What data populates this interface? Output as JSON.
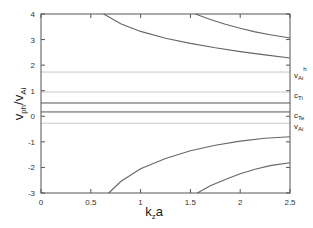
{
  "chart_data": {
    "type": "line",
    "title": "",
    "xlabel": "k_z a",
    "ylabel": "v_ph / v_Ai",
    "xlim": [
      0,
      2.5
    ],
    "ylim": [
      -3,
      4
    ],
    "grid": false,
    "legend": null,
    "x_ticks": [
      0,
      0.5,
      1,
      1.5,
      2,
      2.5
    ],
    "x_tick_labels": [
      "0",
      "0.5",
      "1",
      "1.5",
      "2",
      "2.5"
    ],
    "y_ticks": [
      -3,
      -2,
      -1,
      0,
      1,
      2,
      3,
      4
    ],
    "y_tick_labels": [
      "-3",
      "-2",
      "-1",
      "0",
      "1",
      "2",
      "3",
      "4"
    ],
    "horizontal_lines": [
      {
        "name": "v_Ai^h",
        "y": 1.73,
        "color": "#c8c8c8",
        "label": "v",
        "sub": "Ai",
        "sup": "h"
      },
      {
        "name": "c_Ti",
        "y": 0.95,
        "color": "#c8c8c8",
        "label": "c",
        "sub": "Ti",
        "sup": ""
      },
      {
        "name": "line_0.52",
        "y": 0.52,
        "color": "#555555",
        "label": "",
        "sub": "",
        "sup": ""
      },
      {
        "name": "c_Te",
        "y": 0.17,
        "color": "#555555",
        "label": "c",
        "sub": "Te",
        "sup": ""
      },
      {
        "name": "v_Ai",
        "y": -0.27,
        "color": "#c8c8c8",
        "label": "v",
        "sub": "Ai",
        "sup": ""
      }
    ],
    "series": [
      {
        "name": "upper-branch-1",
        "x": [
          0.63,
          0.8,
          1.0,
          1.25,
          1.5,
          1.75,
          2.0,
          2.25,
          2.5
        ],
        "y": [
          4.0,
          3.62,
          3.32,
          3.05,
          2.85,
          2.68,
          2.53,
          2.4,
          2.28
        ]
      },
      {
        "name": "upper-branch-2",
        "x": [
          1.55,
          1.7,
          1.85,
          2.0,
          2.15,
          2.3,
          2.5
        ],
        "y": [
          4.0,
          3.78,
          3.6,
          3.44,
          3.3,
          3.19,
          3.06
        ]
      },
      {
        "name": "lower-branch-1",
        "x": [
          0.68,
          0.8,
          1.0,
          1.25,
          1.5,
          1.75,
          2.0,
          2.25,
          2.5
        ],
        "y": [
          -3.0,
          -2.55,
          -2.05,
          -1.65,
          -1.35,
          -1.13,
          -0.97,
          -0.86,
          -0.8
        ]
      },
      {
        "name": "lower-branch-2",
        "x": [
          1.57,
          1.7,
          1.85,
          2.0,
          2.15,
          2.3,
          2.5
        ],
        "y": [
          -3.0,
          -2.72,
          -2.47,
          -2.25,
          -2.07,
          -1.93,
          -1.82
        ]
      }
    ],
    "series_color": "#666666"
  },
  "labels": {
    "xlabel_main": "k",
    "xlabel_sub": "z",
    "xlabel_tail": "a",
    "ylabel_main": "v",
    "ylabel_sub1": "ph",
    "ylabel_slash": "/v",
    "ylabel_sub2": "Ai"
  }
}
